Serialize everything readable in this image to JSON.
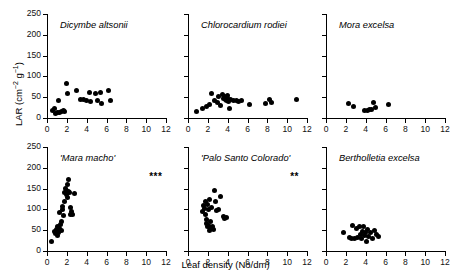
{
  "figure": {
    "ylabel_text": "LAR (cm",
    "ylabel_sup1": "-2",
    "ylabel_mid": " g",
    "ylabel_sup2": "-1",
    "ylabel_end": ")",
    "ylabel_full": "LAR (cm-2 g-1)",
    "xlabel": "Leaf density (No/dm)"
  },
  "chart_data": [
    {
      "type": "scatter",
      "title": "Dicymbe altsonii",
      "panel": "top-left",
      "xlabel": "Leaf density (No/dm)",
      "ylabel": "LAR (cm-2 g-1)",
      "xlim": [
        0,
        12
      ],
      "ylim": [
        0,
        250
      ],
      "xticks": [
        0,
        2,
        4,
        6,
        8,
        10,
        12
      ],
      "yticks": [
        0,
        50,
        100,
        150,
        200,
        250
      ],
      "show_yticklabels": true,
      "significance": "",
      "grid": false,
      "points": [
        {
          "x": 0.6,
          "y": 18
        },
        {
          "x": 0.8,
          "y": 22
        },
        {
          "x": 0.9,
          "y": 12
        },
        {
          "x": 1.1,
          "y": 14
        },
        {
          "x": 1.2,
          "y": 41
        },
        {
          "x": 1.3,
          "y": 13
        },
        {
          "x": 1.5,
          "y": 15
        },
        {
          "x": 1.7,
          "y": 18
        },
        {
          "x": 1.8,
          "y": 16
        },
        {
          "x": 1.95,
          "y": 83
        },
        {
          "x": 2.1,
          "y": 60
        },
        {
          "x": 3.0,
          "y": 66
        },
        {
          "x": 3.4,
          "y": 45
        },
        {
          "x": 3.7,
          "y": 44
        },
        {
          "x": 4.0,
          "y": 43
        },
        {
          "x": 4.3,
          "y": 62
        },
        {
          "x": 4.4,
          "y": 40
        },
        {
          "x": 4.9,
          "y": 58
        },
        {
          "x": 5.1,
          "y": 41
        },
        {
          "x": 5.4,
          "y": 62
        },
        {
          "x": 5.5,
          "y": 36
        },
        {
          "x": 6.2,
          "y": 65
        },
        {
          "x": 6.4,
          "y": 42
        }
      ]
    },
    {
      "type": "scatter",
      "title": "Chlorocardium rodiei",
      "panel": "top-middle",
      "xlabel": "Leaf density (No/dm)",
      "ylabel": "LAR (cm-2 g-1)",
      "xlim": [
        0,
        12
      ],
      "ylim": [
        0,
        250
      ],
      "xticks": [
        0,
        2,
        4,
        6,
        8,
        10,
        12
      ],
      "yticks": [
        0,
        50,
        100,
        150,
        200,
        250
      ],
      "show_yticklabels": false,
      "significance": "",
      "grid": false,
      "points": [
        {
          "x": 0.9,
          "y": 15
        },
        {
          "x": 1.5,
          "y": 24
        },
        {
          "x": 1.9,
          "y": 28
        },
        {
          "x": 2.2,
          "y": 33
        },
        {
          "x": 2.4,
          "y": 60
        },
        {
          "x": 2.7,
          "y": 42
        },
        {
          "x": 3.0,
          "y": 38
        },
        {
          "x": 3.1,
          "y": 52
        },
        {
          "x": 3.3,
          "y": 30
        },
        {
          "x": 3.5,
          "y": 56
        },
        {
          "x": 3.6,
          "y": 48
        },
        {
          "x": 3.7,
          "y": 52
        },
        {
          "x": 3.8,
          "y": 45
        },
        {
          "x": 3.85,
          "y": 50
        },
        {
          "x": 3.9,
          "y": 42
        },
        {
          "x": 3.95,
          "y": 55
        },
        {
          "x": 4.0,
          "y": 47
        },
        {
          "x": 4.1,
          "y": 40
        },
        {
          "x": 4.15,
          "y": 22
        },
        {
          "x": 4.3,
          "y": 44
        },
        {
          "x": 4.6,
          "y": 43
        },
        {
          "x": 4.9,
          "y": 42
        },
        {
          "x": 5.1,
          "y": 40
        },
        {
          "x": 5.4,
          "y": 41
        },
        {
          "x": 6.2,
          "y": 33
        },
        {
          "x": 7.8,
          "y": 36
        },
        {
          "x": 8.2,
          "y": 44
        },
        {
          "x": 8.4,
          "y": 38
        },
        {
          "x": 10.9,
          "y": 45
        }
      ]
    },
    {
      "type": "scatter",
      "title": "Mora excelsa",
      "panel": "top-right",
      "xlabel": "Leaf density (No/dm)",
      "ylabel": "LAR (cm-2 g-1)",
      "xlim": [
        0,
        12
      ],
      "ylim": [
        0,
        250
      ],
      "xticks": [
        0,
        2,
        4,
        6,
        8,
        10,
        12
      ],
      "yticks": [
        0,
        50,
        100,
        150,
        200,
        250
      ],
      "show_yticklabels": false,
      "significance": "",
      "grid": false,
      "points": [
        {
          "x": 2.3,
          "y": 36
        },
        {
          "x": 2.8,
          "y": 28
        },
        {
          "x": 3.9,
          "y": 18
        },
        {
          "x": 4.2,
          "y": 19
        },
        {
          "x": 4.4,
          "y": 20
        },
        {
          "x": 4.6,
          "y": 21
        },
        {
          "x": 4.8,
          "y": 38
        },
        {
          "x": 5.0,
          "y": 25
        },
        {
          "x": 6.3,
          "y": 32
        }
      ]
    },
    {
      "type": "scatter",
      "title": "'Mara macho'",
      "panel": "bottom-left",
      "xlabel": "Leaf density (No/dm)",
      "ylabel": "LAR (cm-2 g-1)",
      "xlim": [
        0,
        12
      ],
      "ylim": [
        0,
        250
      ],
      "xticks": [
        0,
        2,
        4,
        6,
        8,
        10,
        12
      ],
      "yticks": [
        0,
        50,
        100,
        150,
        200,
        250
      ],
      "show_yticklabels": true,
      "significance": "***",
      "grid": false,
      "points": [
        {
          "x": 0.5,
          "y": 24
        },
        {
          "x": 0.8,
          "y": 48
        },
        {
          "x": 0.9,
          "y": 42
        },
        {
          "x": 1.0,
          "y": 52
        },
        {
          "x": 1.05,
          "y": 38
        },
        {
          "x": 1.1,
          "y": 60
        },
        {
          "x": 1.2,
          "y": 45
        },
        {
          "x": 1.25,
          "y": 55
        },
        {
          "x": 1.3,
          "y": 92
        },
        {
          "x": 1.4,
          "y": 63
        },
        {
          "x": 1.45,
          "y": 50
        },
        {
          "x": 1.5,
          "y": 70
        },
        {
          "x": 1.55,
          "y": 100
        },
        {
          "x": 1.6,
          "y": 108
        },
        {
          "x": 1.7,
          "y": 86
        },
        {
          "x": 1.75,
          "y": 120
        },
        {
          "x": 1.8,
          "y": 140
        },
        {
          "x": 1.9,
          "y": 150
        },
        {
          "x": 1.95,
          "y": 135
        },
        {
          "x": 2.0,
          "y": 145
        },
        {
          "x": 2.05,
          "y": 128
        },
        {
          "x": 2.1,
          "y": 160
        },
        {
          "x": 2.15,
          "y": 142
        },
        {
          "x": 2.2,
          "y": 173
        },
        {
          "x": 2.3,
          "y": 140
        },
        {
          "x": 2.35,
          "y": 105
        },
        {
          "x": 2.4,
          "y": 88
        },
        {
          "x": 2.5,
          "y": 95
        },
        {
          "x": 2.6,
          "y": 88
        },
        {
          "x": 2.75,
          "y": 138
        }
      ]
    },
    {
      "type": "scatter",
      "title": "'Palo Santo Colorado'",
      "panel": "bottom-middle",
      "xlabel": "Leaf density (No/dm)",
      "ylabel": "LAR (cm-2 g-1)",
      "xlim": [
        0,
        12
      ],
      "ylim": [
        0,
        250
      ],
      "xticks": [
        0,
        2,
        4,
        6,
        8,
        10,
        12
      ],
      "yticks": [
        0,
        50,
        100,
        150,
        200,
        250
      ],
      "show_yticklabels": false,
      "significance": "**",
      "grid": false,
      "points": [
        {
          "x": 1.5,
          "y": 95
        },
        {
          "x": 1.6,
          "y": 110
        },
        {
          "x": 1.7,
          "y": 102
        },
        {
          "x": 1.75,
          "y": 88
        },
        {
          "x": 1.8,
          "y": 118
        },
        {
          "x": 1.85,
          "y": 75
        },
        {
          "x": 1.9,
          "y": 66
        },
        {
          "x": 1.95,
          "y": 58
        },
        {
          "x": 2.0,
          "y": 112
        },
        {
          "x": 2.05,
          "y": 100
        },
        {
          "x": 2.1,
          "y": 62
        },
        {
          "x": 2.15,
          "y": 50
        },
        {
          "x": 2.2,
          "y": 125
        },
        {
          "x": 2.25,
          "y": 70
        },
        {
          "x": 2.3,
          "y": 55
        },
        {
          "x": 2.4,
          "y": 105
        },
        {
          "x": 2.5,
          "y": 60
        },
        {
          "x": 2.55,
          "y": 52
        },
        {
          "x": 2.7,
          "y": 145
        },
        {
          "x": 2.8,
          "y": 118
        },
        {
          "x": 2.9,
          "y": 98
        },
        {
          "x": 3.1,
          "y": 100
        },
        {
          "x": 3.3,
          "y": 130
        },
        {
          "x": 3.6,
          "y": 82
        },
        {
          "x": 3.7,
          "y": 78
        },
        {
          "x": 3.9,
          "y": 80
        }
      ]
    },
    {
      "type": "scatter",
      "title": "Bertholletia excelsa",
      "panel": "bottom-right",
      "xlabel": "Leaf density (No/dm)",
      "ylabel": "LAR (cm-2 g-1)",
      "xlim": [
        0,
        12
      ],
      "ylim": [
        0,
        250
      ],
      "xticks": [
        0,
        2,
        4,
        6,
        8,
        10,
        12
      ],
      "yticks": [
        0,
        50,
        100,
        150,
        200,
        250
      ],
      "show_yticklabels": false,
      "significance": "",
      "grid": false,
      "points": [
        {
          "x": 1.8,
          "y": 44
        },
        {
          "x": 2.4,
          "y": 32
        },
        {
          "x": 2.6,
          "y": 30
        },
        {
          "x": 2.7,
          "y": 62
        },
        {
          "x": 2.9,
          "y": 31
        },
        {
          "x": 3.1,
          "y": 55
        },
        {
          "x": 3.2,
          "y": 33
        },
        {
          "x": 3.4,
          "y": 60
        },
        {
          "x": 3.5,
          "y": 40
        },
        {
          "x": 3.6,
          "y": 30
        },
        {
          "x": 3.7,
          "y": 46
        },
        {
          "x": 3.8,
          "y": 58
        },
        {
          "x": 3.9,
          "y": 38
        },
        {
          "x": 4.0,
          "y": 44
        },
        {
          "x": 4.1,
          "y": 24
        },
        {
          "x": 4.2,
          "y": 52
        },
        {
          "x": 4.3,
          "y": 36
        },
        {
          "x": 4.5,
          "y": 45
        },
        {
          "x": 4.7,
          "y": 30
        },
        {
          "x": 4.9,
          "y": 50
        },
        {
          "x": 5.1,
          "y": 40
        },
        {
          "x": 5.3,
          "y": 36
        }
      ]
    }
  ],
  "panel_layout": [
    {
      "left": 47,
      "top": 14,
      "width": 119,
      "height": 104,
      "row": 0,
      "col": 0
    },
    {
      "left": 188,
      "top": 14,
      "width": 119,
      "height": 104,
      "row": 0,
      "col": 1
    },
    {
      "left": 326,
      "top": 14,
      "width": 119,
      "height": 104,
      "row": 0,
      "col": 2
    },
    {
      "left": 47,
      "top": 147,
      "width": 119,
      "height": 104,
      "row": 1,
      "col": 0
    },
    {
      "left": 188,
      "top": 147,
      "width": 119,
      "height": 104,
      "row": 1,
      "col": 1
    },
    {
      "left": 326,
      "top": 147,
      "width": 119,
      "height": 104,
      "row": 1,
      "col": 2
    }
  ]
}
